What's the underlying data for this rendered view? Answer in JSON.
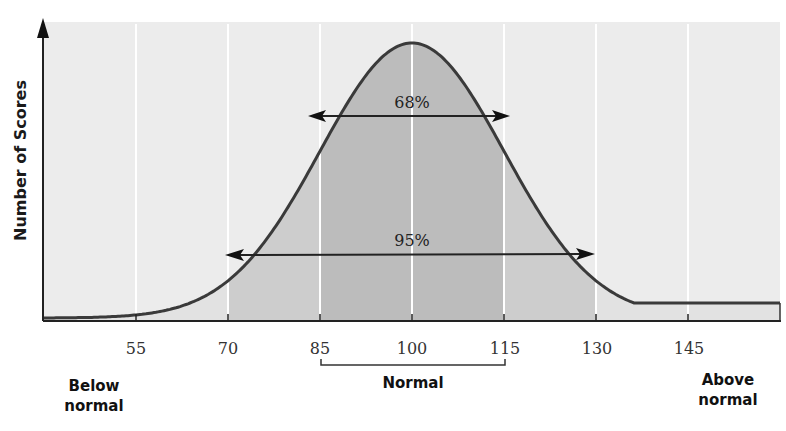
{
  "chart_data": {
    "type": "area",
    "title": "",
    "xlabel": "",
    "ylabel": "Number of Scores",
    "distribution": "normal",
    "mean": 100,
    "sd": 15,
    "x_ticks": [
      55,
      70,
      85,
      100,
      115,
      130,
      145
    ],
    "x_tick_labels": [
      "55",
      "70",
      "85",
      "100",
      "115",
      "130",
      "145"
    ],
    "xlim": [
      40,
      160
    ],
    "grid": "vertical lines at ticks",
    "annotations": [
      {
        "label": "68%",
        "range": [
          85,
          115
        ]
      },
      {
        "label": "95%",
        "range": [
          70,
          130
        ]
      }
    ],
    "categories": [
      {
        "label": "Below normal",
        "position": "left"
      },
      {
        "label": "Normal",
        "range": [
          85,
          115
        ]
      },
      {
        "label": "Above normal",
        "position": "right"
      }
    ],
    "shading": {
      "outer": "#e8e8e8",
      "two_sd": "#cfcfcf",
      "one_sd": "#bdbdbd"
    }
  },
  "labels": {
    "ylabel": "Number of Scores",
    "ticks": [
      "55",
      "70",
      "85",
      "100",
      "115",
      "130",
      "145"
    ],
    "pct68": "68%",
    "pct95": "95%",
    "below_line1": "Below",
    "below_line2": "normal",
    "normal": "Normal",
    "above_line1": "Above",
    "above_line2": "normal"
  }
}
